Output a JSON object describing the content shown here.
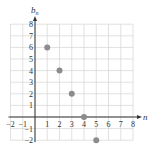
{
  "chart_data": {
    "type": "scatter",
    "title": "",
    "xlabel": "n",
    "ylabel": "b_n",
    "xlim": [
      -2,
      8
    ],
    "ylim": [
      -2,
      8
    ],
    "grid": true,
    "x_ticks": [
      -2,
      -1,
      1,
      2,
      3,
      4,
      5,
      6,
      7,
      8
    ],
    "y_ticks": [
      -2,
      -1,
      1,
      2,
      3,
      4,
      5,
      6,
      7,
      8
    ],
    "series": [
      {
        "name": "b_n",
        "points": [
          {
            "x": 1,
            "y": 6
          },
          {
            "x": 2,
            "y": 4
          },
          {
            "x": 3,
            "y": 2
          },
          {
            "x": 4,
            "y": 0
          },
          {
            "x": 5,
            "y": -2
          }
        ]
      }
    ],
    "colors": {
      "grid": "#d4d4d4",
      "axis": "#333333",
      "point": "#8c8c8c"
    }
  }
}
